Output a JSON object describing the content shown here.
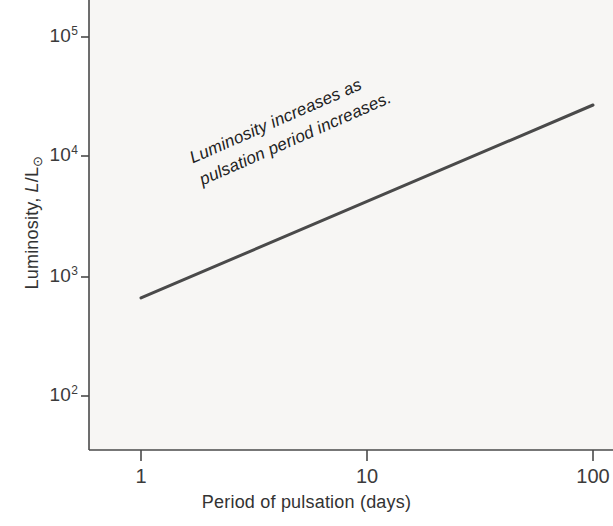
{
  "figure": {
    "background_color": "#ffffff",
    "plot_background_color": "#f7f6f4",
    "axis_color": "#4a4a4a",
    "line_color": "#4a4a4a",
    "text_color": "#333333"
  },
  "axes": {
    "x_title": "Period of pulsation (days)",
    "y_title_prefix": "Luminosity, ",
    "y_title_symbol_num": "L",
    "y_title_slash": "/L",
    "y_title_sun": "⊙",
    "x_tick_labels": [
      "1",
      "10",
      "100"
    ],
    "y_tick_bases": [
      "10",
      "10",
      "10",
      "10"
    ],
    "y_tick_exponents": [
      "5",
      "4",
      "3",
      "2"
    ]
  },
  "annotation": {
    "line1": "Luminosity increases as",
    "line2": "pulsation period increases."
  },
  "chart_data": {
    "type": "line",
    "title": "",
    "subtitle": "",
    "xlabel": "Period of pulsation (days)",
    "ylabel": "Luminosity, L/L⊙",
    "xscale": "log",
    "yscale": "log",
    "xlim": [
      1,
      100
    ],
    "ylim": [
      50,
      200000
    ],
    "x_ticks": [
      1,
      10,
      100
    ],
    "x_tick_labels": [
      "1",
      "10",
      "100"
    ],
    "y_ticks": [
      100,
      1000,
      10000,
      100000
    ],
    "y_tick_labels": [
      "10^2",
      "10^3",
      "10^4",
      "10^5"
    ],
    "grid": false,
    "legend": null,
    "annotations": [
      {
        "text": "Luminosity increases as pulsation period increases.",
        "x": 4.5,
        "y": 5500,
        "rotation_deg": -23.8,
        "style": "italic"
      }
    ],
    "series": [
      {
        "name": "Period-luminosity relation",
        "color": "#4a4a4a",
        "linewidth": 3,
        "x": [
          1,
          10,
          100
        ],
        "y": [
          660,
          4200,
          27000
        ]
      }
    ]
  }
}
